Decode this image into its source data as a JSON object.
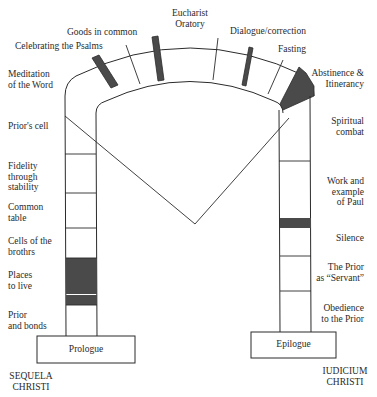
{
  "arch": {
    "labels": {
      "meditation": [
        "Meditation",
        "of the Word"
      ],
      "psalms": "Celebrating the Psalms",
      "goods": "Goods in common",
      "eucharist": [
        "Eucharist",
        "Oratory"
      ],
      "dialogue": "Dialogue/correction",
      "fasting": "Fasting",
      "abstinence": [
        "Abstinence &",
        "Itinerancy"
      ]
    }
  },
  "left_pillar": {
    "labels": {
      "priors_cell": "Prior's cell",
      "fidelity": [
        "Fidelity",
        "through",
        "stability"
      ],
      "common_table": [
        "Common",
        "table"
      ],
      "cells": [
        "Cells of the",
        "brothrs"
      ],
      "places": [
        "Places",
        "to live"
      ],
      "prior_bonds": [
        "Prior",
        "and bonds"
      ]
    },
    "base_label": "Prologue",
    "footer": [
      "SEQUELA",
      "CHRISTI"
    ]
  },
  "right_pillar": {
    "labels": {
      "spiritual": [
        "Spiritual",
        "combat"
      ],
      "work": [
        "Work and",
        "example",
        "of Paul"
      ],
      "silence": "Silence",
      "prior_servant": [
        "The Prior",
        "as “Servant”"
      ],
      "obedience": [
        "Obedience",
        "to the Prior"
      ]
    },
    "base_label": "Epilogue",
    "footer": [
      "IUDICIUM",
      "CHRISTI"
    ]
  },
  "colors": {
    "line": "#2b2b2b",
    "shade": "#4a4a4a",
    "background": "#ffffff"
  }
}
